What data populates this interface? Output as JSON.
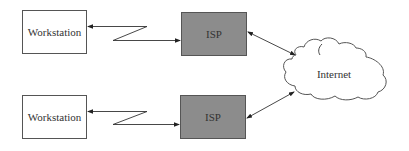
{
  "nodes": {
    "workstation_top": {
      "label": "Workstation"
    },
    "workstation_bottom": {
      "label": "Workstation"
    },
    "isp_top": {
      "label": "ISP"
    },
    "isp_bottom": {
      "label": "ISP"
    },
    "internet": {
      "label": "Internet"
    }
  },
  "colors": {
    "isp_fill": "#8c8c8c",
    "workstation_fill": "#ffffff",
    "line": "#333333"
  },
  "edges": [
    {
      "from": "isp_top",
      "to": "workstation_top",
      "type": "wireless-link",
      "arrows": "both"
    },
    {
      "from": "isp_top",
      "to": "internet",
      "type": "connection",
      "arrows": "both"
    },
    {
      "from": "isp_bottom",
      "to": "workstation_bottom",
      "type": "wireless-link",
      "arrows": "both"
    },
    {
      "from": "isp_bottom",
      "to": "internet",
      "type": "connection",
      "arrows": "both"
    }
  ]
}
